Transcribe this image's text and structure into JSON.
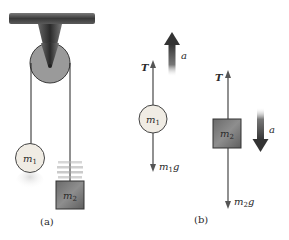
{
  "figure": {
    "panel_a": {
      "caption": "(a)",
      "mass1_label": "m",
      "mass1_sub": "1",
      "mass2_label": "m",
      "mass2_sub": "2"
    },
    "panel_b": {
      "caption": "(b)",
      "body1": {
        "mass_label": "m",
        "mass_sub": "1",
        "tension_label": "T",
        "weight_label_m": "m",
        "weight_label_sub": "1",
        "weight_label_g": "g",
        "accel_label": "a",
        "accel_direction": "up"
      },
      "body2": {
        "mass_label": "m",
        "mass_sub": "2",
        "tension_label": "T",
        "weight_label_m": "m",
        "weight_label_sub": "2",
        "weight_label_g": "g",
        "accel_label": "a",
        "accel_direction": "down"
      }
    },
    "colors": {
      "pulley": "#9a9a9a",
      "ceiling": "#4a4a4a",
      "mass1_fill": "#f0ece4",
      "mass2_fill": "#7a7a7a",
      "force_arrow": "#555555",
      "accel_arrow": "#3a3a3a"
    }
  }
}
